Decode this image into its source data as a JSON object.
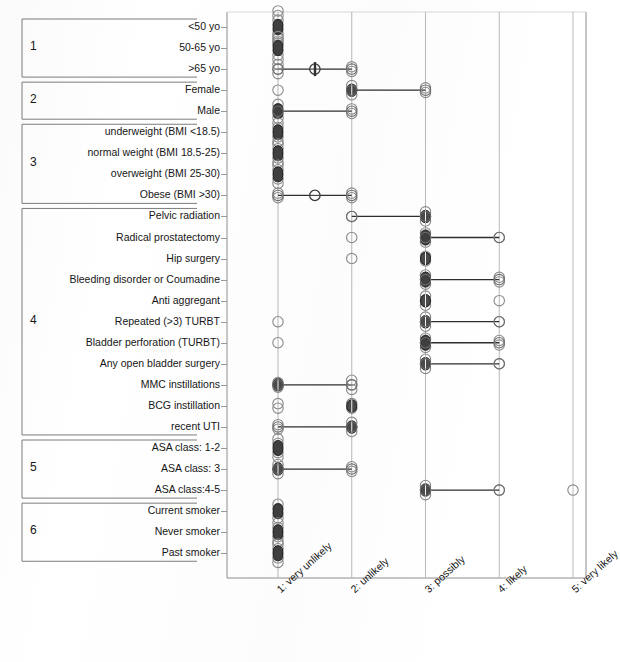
{
  "figure": {
    "caption_fragment": "",
    "rows_count": 24
  },
  "chart_data": {
    "type": "scatter",
    "title": "",
    "xlabel": "",
    "ylabel": "",
    "orientation": "horizontal",
    "grid": true,
    "legend": "none",
    "xlim": [
      1,
      5
    ],
    "xticks": [
      1,
      2,
      3,
      4,
      5
    ],
    "xticklabels": [
      "1: very unlikely",
      "2: unlikely",
      "3: possibly",
      "4: likely",
      "5: very likely"
    ],
    "groups": [
      {
        "number": "1",
        "label": "",
        "rows": [
          "<50 yo",
          "50-65 yo",
          ">65 yo"
        ]
      },
      {
        "number": "2",
        "label": "",
        "rows": [
          "Female",
          "Male"
        ]
      },
      {
        "number": "3",
        "label": "",
        "rows": [
          "underweight (BMI <18.5)",
          "normal weight (BMI 18.5-25)",
          "overweight (BMI 25-30)",
          "Obese (BMI >30)"
        ]
      },
      {
        "number": "4",
        "label": "",
        "rows": [
          "Pelvic radiation",
          "Radical prostatectomy",
          "Hip surgery",
          "Bleeding disorder or Coumadine",
          "Anti aggregant",
          "Repeated (>3) TURBT",
          "Bladder perforation (TURBT)",
          "Any open bladder surgery",
          "MMC instillations",
          "BCG instillation",
          "recent UTI"
        ]
      },
      {
        "number": "5",
        "label": "",
        "rows": [
          "ASA class: 1-2",
          "ASA class: 3",
          "ASA class:4-5"
        ]
      },
      {
        "number": "6",
        "label": "",
        "rows": [
          "Current smoker",
          "Never smoker",
          "Past smoker"
        ]
      }
    ],
    "categories": [
      "<50 yo",
      "50-65 yo",
      ">65 yo",
      "Female",
      "Male",
      "underweight (BMI <18.5)",
      "normal weight (BMI 18.5-25)",
      "overweight (BMI 25-30)",
      "Obese (BMI >30)",
      "Pelvic radiation",
      "Radical prostatectomy",
      "Hip surgery",
      "Bleeding disorder or Coumadine",
      "Anti aggregant",
      "Repeated (>3) TURBT",
      "Bladder perforation (TURBT)",
      "Any open bladder surgery",
      "MMC instillations",
      "BCG instillation",
      "recent UTI",
      "ASA class: 1-2",
      "ASA class: 3",
      "ASA class:4-5",
      "Current smoker",
      "Never smoker",
      "Past smoker"
    ],
    "points": [
      {
        "row": "<50 yo",
        "values": [
          1,
          1,
          1,
          1,
          1,
          1,
          1,
          1
        ],
        "median": 1,
        "range": [
          1,
          1
        ],
        "density": "high"
      },
      {
        "row": "50-65 yo",
        "values": [
          1,
          1,
          1,
          1,
          1,
          1
        ],
        "median": 1,
        "range": [
          1,
          1
        ],
        "density": "high"
      },
      {
        "row": ">65 yo",
        "values": [
          1,
          1,
          1,
          2,
          2
        ],
        "median": 1.5,
        "range": [
          1,
          2
        ],
        "density": "low"
      },
      {
        "row": "Female",
        "values": [
          1,
          2,
          2,
          2,
          3,
          3
        ],
        "median": 2,
        "range": [
          2,
          3
        ],
        "density": "mid"
      },
      {
        "row": "Male",
        "values": [
          1,
          1,
          1,
          1,
          2,
          2
        ],
        "median": 1,
        "range": [
          1,
          2
        ],
        "density": "high"
      },
      {
        "row": "underweight (BMI <18.5)",
        "values": [
          1,
          1,
          1,
          1,
          1
        ],
        "median": 1,
        "range": [
          1,
          1
        ],
        "density": "high"
      },
      {
        "row": "normal weight (BMI 18.5-25)",
        "values": [
          1,
          1,
          1,
          1,
          1
        ],
        "median": 1,
        "range": [
          1,
          1
        ],
        "density": "high"
      },
      {
        "row": "overweight (BMI 25-30)",
        "values": [
          1,
          1,
          1,
          1,
          1
        ],
        "median": 1,
        "range": [
          1,
          1
        ],
        "density": "high"
      },
      {
        "row": "Obese (BMI >30)",
        "values": [
          1,
          1,
          2,
          2
        ],
        "median": 1.5,
        "range": [
          1,
          2
        ],
        "density": "low"
      },
      {
        "row": "Pelvic radiation",
        "values": [
          2,
          3,
          3,
          3
        ],
        "median": 3,
        "range": [
          2,
          3
        ],
        "density": "mid"
      },
      {
        "row": "Radical prostatectomy",
        "values": [
          2,
          3,
          3,
          3,
          4
        ],
        "median": 3,
        "range": [
          3,
          4
        ],
        "density": "high"
      },
      {
        "row": "Hip surgery",
        "values": [
          2,
          3,
          3
        ],
        "median": 3,
        "range": [
          3,
          3
        ],
        "density": "mid"
      },
      {
        "row": "Bleeding disorder or Coumadine",
        "values": [
          3,
          3,
          3,
          4,
          4
        ],
        "median": 3,
        "range": [
          3,
          4
        ],
        "density": "high"
      },
      {
        "row": "Anti aggregant",
        "values": [
          3,
          3,
          3,
          4
        ],
        "median": 3,
        "range": [
          3,
          3
        ],
        "density": "mid"
      },
      {
        "row": "Repeated (>3) TURBT",
        "values": [
          1,
          3,
          3,
          3,
          4
        ],
        "median": 3,
        "range": [
          3,
          4
        ],
        "density": "mid"
      },
      {
        "row": "Bladder perforation (TURBT)",
        "values": [
          1,
          3,
          3,
          3,
          4,
          4
        ],
        "median": 3,
        "range": [
          3,
          4
        ],
        "density": "high"
      },
      {
        "row": "Any open bladder surgery",
        "values": [
          3,
          3,
          3,
          4
        ],
        "median": 3,
        "range": [
          3,
          4
        ],
        "density": "mid"
      },
      {
        "row": "MMC instillations",
        "values": [
          1,
          1,
          2,
          2,
          2
        ],
        "median": 1,
        "range": [
          1,
          2
        ],
        "density": "mid"
      },
      {
        "row": "BCG instillation",
        "values": [
          1,
          1,
          2,
          2
        ],
        "median": 2,
        "range": [
          2,
          2
        ],
        "density": "mid"
      },
      {
        "row": "recent UTI",
        "values": [
          1,
          1,
          2,
          2,
          2
        ],
        "median": 2,
        "range": [
          1,
          2
        ],
        "density": "mid"
      },
      {
        "row": "ASA class: 1-2",
        "values": [
          1,
          1,
          1,
          1,
          1
        ],
        "median": 1,
        "range": [
          1,
          1
        ],
        "density": "high"
      },
      {
        "row": "ASA class: 3",
        "values": [
          1,
          1,
          1,
          2,
          2
        ],
        "median": 1,
        "range": [
          1,
          2
        ],
        "density": "mid"
      },
      {
        "row": "ASA class:4-5",
        "values": [
          3,
          3,
          3,
          4,
          5
        ],
        "median": 3,
        "range": [
          3,
          4
        ],
        "density": "mid"
      },
      {
        "row": "Current smoker",
        "values": [
          1,
          1,
          1,
          1
        ],
        "median": 1,
        "range": [
          1,
          1
        ],
        "density": "high"
      },
      {
        "row": "Never smoker",
        "values": [
          1,
          1,
          1,
          1,
          1
        ],
        "median": 1,
        "range": [
          1,
          1
        ],
        "density": "high"
      },
      {
        "row": "Past smoker",
        "values": [
          1,
          1,
          1,
          1,
          1
        ],
        "median": 1,
        "range": [
          1,
          1
        ],
        "density": "high"
      }
    ]
  },
  "colors": {
    "marker_open_stroke": "#8a8a8a",
    "marker_dense_fill": "#3f3f3f",
    "grid": "#b9b9b9",
    "axis": "#8e8e8e",
    "line": "#2e2e2e",
    "text": "#161616"
  }
}
